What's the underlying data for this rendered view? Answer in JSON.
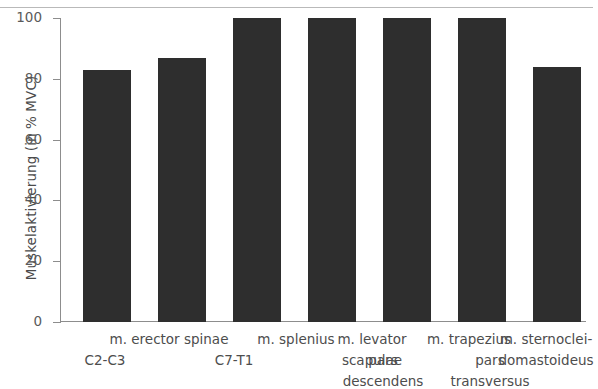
{
  "chart_data": {
    "type": "bar",
    "title": "",
    "xlabel": "",
    "ylabel": "Muskelaktivierung (in % MVC)",
    "ylim": [
      0,
      100
    ],
    "yticks": [
      0,
      20,
      40,
      60,
      80,
      100
    ],
    "grid": false,
    "legend": null,
    "bar_color": "#2e2e2e",
    "axis_color": "#8d8d8d",
    "categories": [
      "m. erector spinae C2-C3",
      "m. erector spinae C7-T1",
      "m. splenius",
      "m. levator scapulae",
      "m. trapezius pars descendens",
      "m. trapezius pars transversus",
      "m. sternocleidomastoideus"
    ],
    "values": [
      83,
      87,
      100,
      100,
      100,
      100,
      84
    ]
  },
  "axis": {
    "y_title": "Muskelaktivierung (in % MVC)",
    "ticks": [
      {
        "value": "100"
      },
      {
        "value": "80"
      },
      {
        "value": "60"
      },
      {
        "value": "40"
      },
      {
        "value": "20"
      },
      {
        "value": "0"
      }
    ]
  },
  "category_labels": {
    "group_erector": "m. erector spinae",
    "erector_c2c3": "C2-C3",
    "erector_c7t1": "C7-T1",
    "splenius": "m. splenius",
    "levator_line1": "m. levator",
    "levator_line2": "scapulae",
    "group_trapezius": "m. trapezius",
    "trapezius_descendens_line1": "pars",
    "trapezius_descendens_line2": "descendens",
    "trapezius_transversus_line1": "pars",
    "trapezius_transversus_line2": "transversus",
    "scm_line1": "m. sternoclei-",
    "scm_line2": "domastoideus"
  }
}
